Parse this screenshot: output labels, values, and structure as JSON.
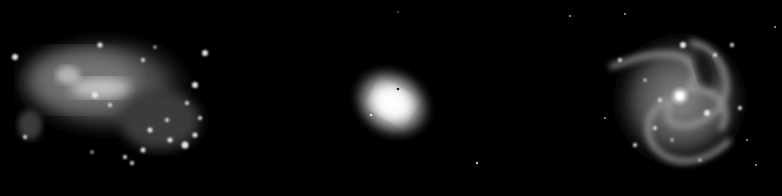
{
  "image": {
    "description": "Three galaxies in grayscale on black background",
    "background": "#000000",
    "panels": [
      {
        "type": "irregular-galaxy",
        "position": "left"
      },
      {
        "type": "elliptical-galaxy",
        "position": "center"
      },
      {
        "type": "spiral-galaxy",
        "position": "right"
      }
    ]
  }
}
